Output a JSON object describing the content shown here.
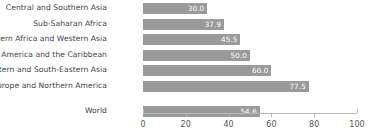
{
  "chart_data": {
    "type": "bar",
    "orientation": "horizontal",
    "title": "",
    "subtitle": "",
    "xlabel": "",
    "ylabel": "",
    "xlim": [
      0,
      100
    ],
    "xticks": [
      0,
      20,
      40,
      60,
      80,
      100
    ],
    "xtick_labels": [
      "0",
      "20",
      "40",
      "60",
      "80",
      "100"
    ],
    "grid": false,
    "legend": false,
    "bar_color": "#9a9a9a",
    "value_label_color": "#ffffff",
    "categories": [
      "Central and Southern Asia",
      "Sub-Saharan Africa",
      "Northern Africa and Western Asia",
      "Latin America and the Caribbean",
      "Eastern and South-Eastern Asia",
      "Europe and Northern America",
      "World"
    ],
    "values": [
      30.0,
      37.9,
      45.5,
      50.0,
      60.0,
      77.5,
      54.6
    ],
    "value_labels": [
      "30.0",
      "37.9",
      "45.5",
      "50.0",
      "60.0",
      "77.5",
      "54.6"
    ],
    "series": [
      {
        "name": "value",
        "values": [
          30.0,
          37.9,
          45.5,
          50.0,
          60.0,
          77.5,
          54.6
        ]
      }
    ],
    "bars": [
      {
        "category": "Central and Southern Asia",
        "value": 30.0,
        "label": "30.0",
        "group": "region"
      },
      {
        "category": "Sub-Saharan Africa",
        "value": 37.9,
        "label": "37.9",
        "group": "region"
      },
      {
        "category": "Northern Africa and Western Asia",
        "value": 45.5,
        "label": "45.5",
        "group": "region"
      },
      {
        "category": "Latin America and the Caribbean",
        "value": 50.0,
        "label": "50.0",
        "group": "region"
      },
      {
        "category": "Eastern and South-Eastern Asia",
        "value": 60.0,
        "label": "60.0",
        "group": "region"
      },
      {
        "category": "Europe and Northern America",
        "value": 77.5,
        "label": "77.5",
        "group": "region"
      },
      {
        "category": "World",
        "value": 54.6,
        "label": "54.6",
        "group": "aggregate"
      }
    ]
  }
}
